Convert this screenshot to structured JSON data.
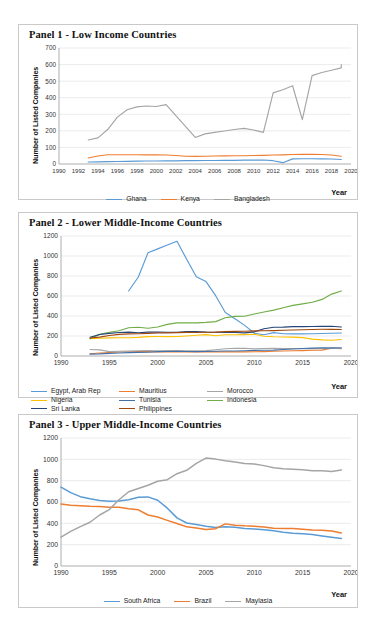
{
  "figure": {
    "ylabel": "Number of Listed Companies",
    "xlabel": "Year"
  },
  "panels": [
    {
      "title": "Panel 1 - Low Income Countries"
    },
    {
      "title": "Panel 2 - Lower Middle-Income Countries"
    },
    {
      "title": "Panel 3 - Upper Middle-Income Countries"
    }
  ],
  "chart_data": [
    {
      "type": "line",
      "title": "Panel 1 - Low Income Countries",
      "xlabel": "Year",
      "ylabel": "Number of Listed Companies",
      "xlim": [
        1990,
        2020
      ],
      "ylim": [
        0,
        700
      ],
      "yticks": [
        0,
        100,
        200,
        300,
        400,
        500,
        600,
        700
      ],
      "xticks": [
        1990,
        1992,
        1994,
        1996,
        1998,
        2000,
        2002,
        2004,
        2006,
        2008,
        2010,
        2012,
        2014,
        2016,
        2018,
        2020
      ],
      "grid": "horizontal",
      "legend_position": "bottom",
      "series": [
        {
          "name": "Ghana",
          "color": "#5B9BD5",
          "x": [
            1993,
            1994,
            1995,
            1996,
            1997,
            1998,
            1999,
            2000,
            2001,
            2002,
            2003,
            2004,
            2005,
            2006,
            2007,
            2008,
            2009,
            2010,
            2011,
            2012,
            2013,
            2014,
            2015,
            2016,
            2017,
            2018,
            2019
          ],
          "values": [
            12,
            13,
            14,
            15,
            16,
            17,
            18,
            18,
            19,
            19,
            20,
            20,
            21,
            21,
            22,
            22,
            23,
            23,
            24,
            20,
            8,
            31,
            32,
            32,
            31,
            30,
            27
          ]
        },
        {
          "name": "Kenya",
          "color": "#ED7D31",
          "x": [
            1993,
            1994,
            1995,
            1996,
            1997,
            1998,
            1999,
            2000,
            2001,
            2002,
            2003,
            2004,
            2005,
            2006,
            2007,
            2008,
            2009,
            2010,
            2011,
            2012,
            2013,
            2014,
            2015,
            2016,
            2017,
            2018,
            2019
          ],
          "values": [
            36,
            48,
            56,
            56,
            56,
            56,
            55,
            55,
            54,
            51,
            47,
            46,
            47,
            48,
            49,
            50,
            50,
            51,
            52,
            54,
            55,
            57,
            58,
            58,
            57,
            54,
            47
          ]
        },
        {
          "name": "Bangladesh",
          "color": "#A5A5A5",
          "x": [
            1993,
            1994,
            1995,
            1996,
            1997,
            1998,
            1999,
            2000,
            2001,
            2004,
            2005,
            2006,
            2007,
            2008,
            2009,
            2010,
            2011,
            2012,
            2013,
            2014,
            2015,
            2016,
            2017,
            2018,
            2019
          ],
          "values": [
            145,
            158,
            208,
            283,
            327,
            345,
            350,
            347,
            358,
            160,
            182,
            191,
            199,
            208,
            215,
            205,
            191,
            429,
            448,
            472,
            268,
            533,
            552,
            566,
            580,
            600
          ]
        }
      ]
    },
    {
      "type": "line",
      "title": "Panel 2 - Lower Middle-Income Countries",
      "xlabel": "Year",
      "ylabel": "Number of Listed Companies",
      "xlim": [
        1990,
        2020
      ],
      "ylim": [
        0,
        1200
      ],
      "yticks": [
        0,
        200,
        400,
        600,
        800,
        1000,
        1200
      ],
      "xticks": [
        1990,
        1995,
        2000,
        2005,
        2010,
        2015,
        2020
      ],
      "grid": "horizontal",
      "legend_position": "bottom",
      "series": [
        {
          "name": "Egypt, Arab Rep",
          "color": "#5B9BD5",
          "x": [
            1997,
            1998,
            1999,
            2000,
            2001,
            2002,
            2003,
            2004,
            2005,
            2006,
            2007,
            2008,
            2009,
            2010,
            2011,
            2012,
            2013,
            2014,
            2015,
            2016,
            2017,
            2018,
            2019
          ],
          "values": [
            650,
            790,
            1032,
            1071,
            1110,
            1148,
            967,
            792,
            744,
            603,
            435,
            373,
            306,
            227,
            213,
            234,
            222,
            221,
            221,
            222,
            225,
            227,
            230
          ]
        },
        {
          "name": "Mauritius",
          "color": "#ED7D31",
          "x": [
            1993,
            1994,
            1995,
            1996,
            1997,
            1998,
            1999,
            2000,
            2001,
            2002,
            2003,
            2004,
            2005,
            2006,
            2007,
            2008,
            2009,
            2010,
            2011,
            2012,
            2013,
            2014,
            2015,
            2016,
            2017,
            2018,
            2019
          ],
          "values": [
            22,
            30,
            35,
            40,
            43,
            44,
            44,
            40,
            40,
            40,
            40,
            41,
            41,
            41,
            41,
            41,
            41,
            43,
            44,
            47,
            50,
            52,
            54,
            57,
            59,
            78,
            73
          ]
        },
        {
          "name": "Morocco",
          "color": "#A5A5A5",
          "x": [
            1993,
            1994,
            1995,
            1996,
            1997,
            1998,
            1999,
            2000,
            2001,
            2002,
            2003,
            2004,
            2005,
            2006,
            2007,
            2008,
            2009,
            2010,
            2011,
            2012,
            2013,
            2014,
            2015,
            2016,
            2017,
            2018,
            2019
          ],
          "values": [
            65,
            61,
            44,
            47,
            49,
            53,
            54,
            53,
            55,
            55,
            52,
            53,
            54,
            63,
            73,
            77,
            76,
            73,
            75,
            77,
            75,
            75,
            74,
            74,
            74,
            75,
            75
          ]
        },
        {
          "name": "Nigeria",
          "color": "#FFC000",
          "x": [
            1993,
            1994,
            1995,
            1996,
            1997,
            1998,
            1999,
            2000,
            2001,
            2002,
            2003,
            2004,
            2005,
            2006,
            2007,
            2008,
            2009,
            2010,
            2011,
            2012,
            2013,
            2014,
            2015,
            2016,
            2017,
            2018,
            2019
          ],
          "values": [
            174,
            177,
            181,
            183,
            182,
            186,
            194,
            195,
            194,
            195,
            200,
            207,
            214,
            202,
            212,
            213,
            214,
            217,
            198,
            192,
            190,
            189,
            184,
            169,
            161,
            157,
            165
          ]
        },
        {
          "name": "Tunisia",
          "color": "#4472A8",
          "x": [
            1993,
            1994,
            1995,
            1996,
            1997,
            1998,
            1999,
            2000,
            2001,
            2002,
            2003,
            2004,
            2005,
            2006,
            2007,
            2008,
            2009,
            2010,
            2011,
            2012,
            2013,
            2014,
            2015,
            2016,
            2017,
            2018,
            2019
          ],
          "values": [
            19,
            21,
            26,
            30,
            34,
            36,
            38,
            44,
            45,
            46,
            45,
            44,
            45,
            48,
            50,
            50,
            52,
            56,
            57,
            59,
            65,
            70,
            75,
            79,
            82,
            81,
            82
          ]
        },
        {
          "name": "Indonesia",
          "color": "#70AD47",
          "x": [
            1993,
            1994,
            1995,
            1996,
            1997,
            1998,
            1999,
            2000,
            2001,
            2002,
            2003,
            2004,
            2005,
            2006,
            2007,
            2008,
            2009,
            2010,
            2011,
            2012,
            2013,
            2014,
            2015,
            2016,
            2017,
            2018,
            2019
          ],
          "values": [
            174,
            216,
            238,
            253,
            282,
            288,
            277,
            290,
            316,
            331,
            333,
            331,
            336,
            344,
            383,
            396,
            398,
            420,
            440,
            459,
            483,
            506,
            521,
            537,
            566,
            619,
            650
          ]
        },
        {
          "name": "Sri Lanka",
          "color": "#264478",
          "x": [
            1993,
            1994,
            1995,
            1996,
            1997,
            1998,
            1999,
            2000,
            2001,
            2002,
            2003,
            2004,
            2005,
            2006,
            2007,
            2008,
            2009,
            2010,
            2011,
            2012,
            2013,
            2014,
            2015,
            2016,
            2017,
            2018,
            2019
          ],
          "values": [
            188,
            215,
            226,
            235,
            239,
            233,
            239,
            239,
            238,
            238,
            244,
            245,
            239,
            237,
            235,
            235,
            231,
            241,
            272,
            287,
            289,
            294,
            294,
            295,
            296,
            297,
            290
          ]
        },
        {
          "name": "Philippines",
          "color": "#9E480E",
          "x": [
            1993,
            1994,
            1995,
            1996,
            1997,
            1998,
            1999,
            2000,
            2001,
            2002,
            2003,
            2004,
            2005,
            2006,
            2007,
            2008,
            2009,
            2010,
            2011,
            2012,
            2013,
            2014,
            2015,
            2016,
            2017,
            2018,
            2019
          ],
          "values": [
            180,
            189,
            205,
            216,
            221,
            222,
            226,
            230,
            231,
            234,
            236,
            235,
            237,
            239,
            244,
            246,
            248,
            251,
            253,
            254,
            257,
            260,
            263,
            265,
            267,
            267,
            265
          ]
        }
      ]
    },
    {
      "type": "line",
      "title": "Panel 3 - Upper Middle-Income Countries",
      "xlabel": "Year",
      "ylabel": "Number of Listed Companies",
      "xlim": [
        1990,
        2020
      ],
      "ylim": [
        0,
        1200
      ],
      "yticks": [
        0,
        200,
        400,
        600,
        800,
        1000,
        1200
      ],
      "xticks": [
        1990,
        1995,
        2000,
        2005,
        2010,
        2015,
        2020
      ],
      "grid": "horizontal",
      "legend_position": "bottom",
      "series": [
        {
          "name": "South Africa",
          "color": "#5B9BD5",
          "x": [
            1990,
            1991,
            1992,
            1993,
            1994,
            1995,
            1996,
            1997,
            1998,
            1999,
            2000,
            2001,
            2002,
            2003,
            2004,
            2005,
            2006,
            2007,
            2008,
            2009,
            2010,
            2011,
            2012,
            2013,
            2014,
            2015,
            2016,
            2017,
            2018,
            2019
          ],
          "values": [
            740,
            688,
            650,
            630,
            614,
            608,
            610,
            622,
            644,
            648,
            616,
            542,
            451,
            403,
            389,
            373,
            360,
            368,
            364,
            352,
            347,
            339,
            330,
            316,
            308,
            303,
            295,
            282,
            270,
            258
          ]
        },
        {
          "name": "Brazil",
          "color": "#ED7D31",
          "x": [
            1990,
            1991,
            1992,
            1993,
            1994,
            1995,
            1996,
            1997,
            1998,
            1999,
            2000,
            2001,
            2002,
            2003,
            2004,
            2005,
            2006,
            2007,
            2008,
            2009,
            2010,
            2011,
            2012,
            2013,
            2014,
            2015,
            2016,
            2017,
            2018,
            2019
          ],
          "values": [
            581,
            570,
            565,
            560,
            558,
            551,
            551,
            536,
            527,
            478,
            459,
            428,
            399,
            367,
            357,
            343,
            350,
            395,
            383,
            377,
            373,
            366,
            353,
            352,
            351,
            345,
            338,
            335,
            329,
            310
          ]
        },
        {
          "name": "Maylasia",
          "color": "#A5A5A5",
          "x": [
            1990,
            1991,
            1992,
            1993,
            1994,
            1995,
            1996,
            1997,
            1998,
            1999,
            2000,
            2001,
            2002,
            2003,
            2004,
            2005,
            2006,
            2007,
            2008,
            2009,
            2010,
            2011,
            2012,
            2013,
            2014,
            2015,
            2016,
            2017,
            2018,
            2019
          ],
          "values": [
            271,
            324,
            369,
            410,
            478,
            529,
            621,
            696,
            727,
            757,
            795,
            809,
            865,
            897,
            962,
            1012,
            1002,
            986,
            976,
            960,
            957,
            941,
            921,
            911,
            906,
            903,
            894,
            892,
            886,
            901
          ]
        }
      ]
    }
  ]
}
